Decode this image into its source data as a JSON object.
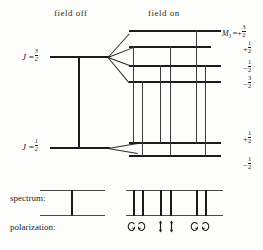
{
  "diagram": {
    "headers": {
      "field_off": "field off",
      "field_on": "field on"
    },
    "row_labels": {
      "spectrum": "spectrum:",
      "polarization": "polarization:"
    },
    "levels": [
      {
        "name": "upper-level",
        "j_label": "J =",
        "j_value_num": "3",
        "j_value_den": "2",
        "zero_field_y": 57,
        "sublevels": [
          {
            "m_num": "3",
            "m_sign": "+",
            "m_den": "2",
            "y": 31,
            "label_head": "M"
          },
          {
            "m_num": "1",
            "m_sign": "+",
            "m_den": "2",
            "y": 47,
            "label_head": ""
          },
          {
            "m_num": "1",
            "m_sign": "−",
            "m_den": "2",
            "y": 66,
            "label_head": ""
          },
          {
            "m_num": "3",
            "m_sign": "−",
            "m_den": "2",
            "y": 82,
            "label_head": ""
          }
        ]
      },
      {
        "name": "lower-level",
        "j_label": "J =",
        "j_value_num": "1",
        "j_value_den": "2",
        "zero_field_y": 148,
        "sublevels": [
          {
            "m_num": "1",
            "m_sign": "+",
            "m_den": "2",
            "y": 143,
            "label_head": ""
          },
          {
            "m_num": "1",
            "m_sign": "−",
            "m_den": "2",
            "y": 156,
            "label_head": ""
          }
        ]
      }
    ],
    "m_head_symbol": "M",
    "m_head_sub": "J",
    "m_head_eq": "=",
    "transitions": {
      "count": 6,
      "x_positions": [
        133,
        142,
        160,
        170,
        196,
        205
      ]
    },
    "spectrum": {
      "field_off": {
        "lines": 1,
        "x_positions": [
          60
        ]
      },
      "field_on": {
        "lines": 6,
        "x_positions": [
          133,
          142,
          160,
          170,
          196,
          205
        ]
      }
    },
    "polarization": {
      "groups": [
        {
          "kind": "sigma",
          "symbols": [
            "sigma-arrow-icon",
            "sigma-arrow-icon"
          ],
          "x_positions": [
            129,
            139
          ]
        },
        {
          "kind": "pi",
          "symbols": [
            "pi-arrow-icon",
            "pi-arrow-icon"
          ],
          "x_positions": [
            159,
            170
          ]
        },
        {
          "kind": "sigma",
          "symbols": [
            "sigma-arrow-icon",
            "sigma-arrow-icon"
          ],
          "x_positions": [
            192,
            203
          ]
        }
      ]
    },
    "colors": {
      "ink": "#1b1b1b",
      "ink_light": "#4a4a4a",
      "background": "#fdfdfb"
    }
  }
}
